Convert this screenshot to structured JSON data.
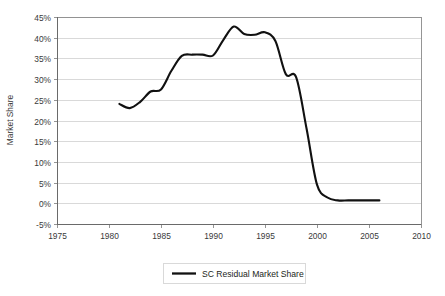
{
  "chart_data": {
    "type": "line",
    "title": "",
    "xlabel": "",
    "ylabel": "Market Share",
    "xlim": [
      1975,
      2010
    ],
    "ylim": [
      -0.05,
      0.45
    ],
    "xticks": [
      "1975",
      "1980",
      "1985",
      "1990",
      "1995",
      "2000",
      "2005",
      "2010"
    ],
    "xtick_values": [
      1975,
      1980,
      1985,
      1990,
      1995,
      2000,
      2005,
      2010
    ],
    "yticks": [
      "-5%",
      "0%",
      "5%",
      "10%",
      "15%",
      "20%",
      "25%",
      "30%",
      "35%",
      "40%",
      "45%"
    ],
    "ytick_values": [
      -5,
      0,
      5,
      10,
      15,
      20,
      25,
      30,
      35,
      40,
      45
    ],
    "grid": "horizontal",
    "legend_position": "bottom-center",
    "series": [
      {
        "name": "SC Residual Market Share",
        "color": "#111111",
        "x": [
          1981,
          1982,
          1983,
          1984,
          1985,
          1986,
          1987,
          1988,
          1989,
          1990,
          1991,
          1992,
          1993,
          1994,
          1995,
          1996,
          1997,
          1998,
          1999,
          2000,
          2001,
          2002,
          2003,
          2004,
          2005,
          2006
        ],
        "values": [
          24.0,
          23.0,
          24.5,
          27.0,
          27.5,
          32.0,
          35.6,
          35.9,
          35.9,
          35.7,
          39.5,
          42.7,
          40.9,
          40.7,
          41.3,
          39.2,
          31.2,
          30.4,
          18.0,
          4.5,
          1.4,
          0.7,
          0.7,
          0.7,
          0.7,
          0.7
        ]
      }
    ]
  },
  "legend": {
    "entries": [
      {
        "label": "SC Residual Market Share"
      }
    ]
  },
  "axes": {
    "y_title": "Market Share"
  }
}
